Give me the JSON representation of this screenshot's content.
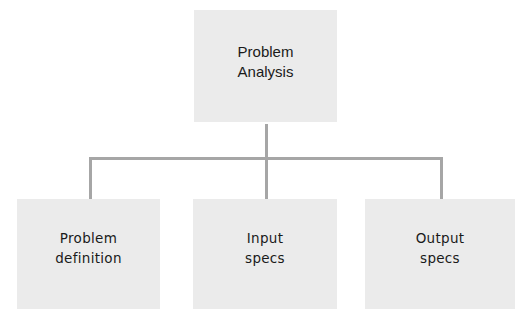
{
  "diagram": {
    "type": "hierarchy-tree",
    "colors": {
      "node_fill": "#ebebeb",
      "connector": "#a6a6a6",
      "text": "#1a1a1a"
    },
    "root": {
      "label": "Problem\nAnalysis"
    },
    "children": [
      {
        "label": "Problem\ndefinition"
      },
      {
        "label": "Input\nspecs"
      },
      {
        "label": "Output\nspecs"
      }
    ],
    "edges": [
      {
        "from": "Problem Analysis",
        "to": "Problem definition"
      },
      {
        "from": "Problem Analysis",
        "to": "Input specs"
      },
      {
        "from": "Problem Analysis",
        "to": "Output specs"
      }
    ]
  }
}
